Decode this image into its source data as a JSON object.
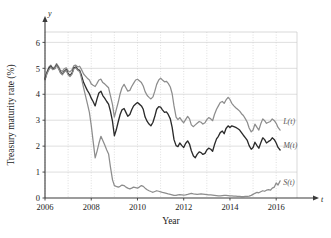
{
  "figure": {
    "ylabel": "Treasury maturity rate (%)",
    "xlabel": "Year",
    "y_axis_name": "y",
    "x_axis_name": "t",
    "yticks": [
      "0",
      "1",
      "2",
      "3",
      "4",
      "5",
      "6"
    ],
    "xticks": [
      "2006",
      "2008",
      "2010",
      "2012",
      "2014",
      "2016"
    ],
    "series_labels": {
      "long": "L(t)",
      "medium": "M(t)",
      "short": "S(t)"
    },
    "colors": {
      "long": "#8d8d8d",
      "medium": "#2b2b2b",
      "short": "#8d8d8d",
      "axis": "#3a3a3a",
      "grid": "#c9c9c9",
      "background": "#ffffff"
    }
  },
  "chart_data": {
    "type": "line",
    "title": "",
    "xlabel": "Year",
    "ylabel": "Treasury maturity rate (%)",
    "xlim": [
      2006,
      2016.9
    ],
    "ylim": [
      0,
      6.4
    ],
    "xticks": [
      2006,
      2008,
      2010,
      2012,
      2014,
      2016
    ],
    "yticks": [
      0,
      1,
      2,
      3,
      4,
      5,
      6
    ],
    "grid": true,
    "grid_minor_x_every": 1,
    "legend": "inline-right-of-curve",
    "annotations": [
      {
        "text": "L(t)",
        "x": 2016.3,
        "y": 2.95
      },
      {
        "text": "M(t)",
        "x": 2016.3,
        "y": 2.05
      },
      {
        "text": "S(t)",
        "x": 2016.3,
        "y": 0.62
      }
    ],
    "x": [
      2006.0,
      2006.08,
      2006.17,
      2006.25,
      2006.33,
      2006.42,
      2006.5,
      2006.58,
      2006.67,
      2006.75,
      2006.83,
      2006.92,
      2007.0,
      2007.08,
      2007.17,
      2007.25,
      2007.33,
      2007.42,
      2007.5,
      2007.58,
      2007.67,
      2007.75,
      2007.83,
      2007.92,
      2008.0,
      2008.08,
      2008.17,
      2008.25,
      2008.33,
      2008.42,
      2008.5,
      2008.58,
      2008.67,
      2008.75,
      2008.83,
      2008.92,
      2009.0,
      2009.08,
      2009.17,
      2009.25,
      2009.33,
      2009.42,
      2009.5,
      2009.58,
      2009.67,
      2009.75,
      2009.83,
      2009.92,
      2010.0,
      2010.08,
      2010.17,
      2010.25,
      2010.33,
      2010.42,
      2010.5,
      2010.58,
      2010.67,
      2010.75,
      2010.83,
      2010.92,
      2011.0,
      2011.08,
      2011.17,
      2011.25,
      2011.33,
      2011.42,
      2011.5,
      2011.58,
      2011.67,
      2011.75,
      2011.83,
      2011.92,
      2012.0,
      2012.08,
      2012.17,
      2012.25,
      2012.33,
      2012.42,
      2012.5,
      2012.58,
      2012.67,
      2012.75,
      2012.83,
      2012.92,
      2013.0,
      2013.08,
      2013.17,
      2013.25,
      2013.33,
      2013.42,
      2013.5,
      2013.58,
      2013.67,
      2013.75,
      2013.83,
      2013.92,
      2014.0,
      2014.08,
      2014.17,
      2014.25,
      2014.33,
      2014.42,
      2014.5,
      2014.58,
      2014.67,
      2014.75,
      2014.83,
      2014.92,
      2015.0,
      2015.08,
      2015.17,
      2015.25,
      2015.33,
      2015.42,
      2015.5,
      2015.58,
      2015.67,
      2015.75,
      2015.83,
      2015.92,
      2016.0,
      2016.08,
      2016.17
    ],
    "series": [
      {
        "name": "L(t)",
        "label": "Long maturity rate",
        "color": "#8d8d8d",
        "values": [
          4.62,
          4.85,
          5.05,
          5.12,
          5.02,
          5.05,
          5.18,
          5.08,
          4.92,
          4.88,
          4.98,
          5.02,
          4.9,
          4.86,
          4.95,
          5.1,
          5.12,
          5.05,
          5.08,
          4.95,
          4.78,
          4.7,
          4.62,
          4.55,
          4.4,
          4.35,
          4.3,
          4.42,
          4.55,
          4.58,
          4.45,
          4.4,
          4.32,
          4.25,
          3.95,
          3.6,
          3.12,
          3.4,
          3.7,
          4.02,
          4.25,
          4.38,
          4.25,
          4.12,
          4.15,
          4.3,
          4.42,
          4.55,
          4.58,
          4.52,
          4.45,
          4.32,
          4.1,
          3.95,
          3.88,
          3.82,
          3.9,
          4.12,
          4.38,
          4.55,
          4.62,
          4.55,
          4.48,
          4.5,
          4.42,
          4.28,
          4.02,
          3.55,
          3.12,
          3.02,
          3.1,
          2.98,
          2.9,
          3.02,
          3.15,
          3.05,
          2.82,
          2.75,
          2.82,
          2.88,
          2.95,
          2.92,
          2.85,
          2.9,
          3.02,
          3.1,
          3.05,
          2.98,
          3.22,
          3.42,
          3.55,
          3.68,
          3.72,
          3.65,
          3.78,
          3.88,
          3.8,
          3.65,
          3.55,
          3.48,
          3.42,
          3.35,
          3.25,
          3.18,
          3.05,
          2.92,
          2.7,
          2.55,
          2.62,
          2.85,
          2.72,
          2.62,
          2.85,
          3.05,
          2.98,
          2.88,
          2.92,
          2.95,
          3.05,
          2.98,
          2.88,
          2.72,
          2.62
        ]
      },
      {
        "name": "M(t)",
        "label": "Medium maturity rate",
        "color": "#2b2b2b",
        "values": [
          4.58,
          4.82,
          5.0,
          5.08,
          4.98,
          5.0,
          5.12,
          5.02,
          4.85,
          4.78,
          4.88,
          4.95,
          4.8,
          4.72,
          4.82,
          5.02,
          5.05,
          4.95,
          4.92,
          4.72,
          4.45,
          4.3,
          4.15,
          4.02,
          3.85,
          3.72,
          3.55,
          3.82,
          4.05,
          4.12,
          3.95,
          3.85,
          3.72,
          3.62,
          3.35,
          2.95,
          2.4,
          2.62,
          2.95,
          3.22,
          3.4,
          3.45,
          3.3,
          3.15,
          3.22,
          3.4,
          3.55,
          3.62,
          3.68,
          3.62,
          3.55,
          3.42,
          3.12,
          2.95,
          2.85,
          2.78,
          2.92,
          3.15,
          3.42,
          3.52,
          3.5,
          3.4,
          3.3,
          3.32,
          3.22,
          3.05,
          2.72,
          2.25,
          2.02,
          1.98,
          2.12,
          2.02,
          1.95,
          2.1,
          2.2,
          2.08,
          1.82,
          1.62,
          1.55,
          1.68,
          1.78,
          1.75,
          1.68,
          1.72,
          1.85,
          1.92,
          1.88,
          1.8,
          2.05,
          2.28,
          2.38,
          2.52,
          2.58,
          2.48,
          2.68,
          2.78,
          2.72,
          2.78,
          2.75,
          2.72,
          2.68,
          2.62,
          2.52,
          2.42,
          2.32,
          2.22,
          2.02,
          1.88,
          1.95,
          2.15,
          2.02,
          1.92,
          2.12,
          2.32,
          2.25,
          2.12,
          2.18,
          2.22,
          2.32,
          2.25,
          2.12,
          1.95,
          1.85
        ]
      },
      {
        "name": "S(t)",
        "label": "Short maturity rate",
        "color": "#8d8d8d",
        "values": [
          4.55,
          4.78,
          4.95,
          5.05,
          4.95,
          4.98,
          5.1,
          5.0,
          4.82,
          4.75,
          4.85,
          4.92,
          4.75,
          4.68,
          4.78,
          4.98,
          5.02,
          4.92,
          4.88,
          4.6,
          4.25,
          3.95,
          3.65,
          3.3,
          2.8,
          2.2,
          1.55,
          1.8,
          2.1,
          2.38,
          2.22,
          2.05,
          1.85,
          1.7,
          1.2,
          0.7,
          0.48,
          0.45,
          0.42,
          0.45,
          0.5,
          0.48,
          0.42,
          0.38,
          0.35,
          0.38,
          0.42,
          0.4,
          0.38,
          0.42,
          0.48,
          0.45,
          0.38,
          0.32,
          0.28,
          0.25,
          0.22,
          0.25,
          0.28,
          0.26,
          0.24,
          0.22,
          0.2,
          0.18,
          0.16,
          0.14,
          0.12,
          0.1,
          0.1,
          0.12,
          0.13,
          0.12,
          0.11,
          0.12,
          0.14,
          0.16,
          0.18,
          0.16,
          0.15,
          0.14,
          0.15,
          0.16,
          0.15,
          0.14,
          0.13,
          0.12,
          0.12,
          0.11,
          0.1,
          0.09,
          0.08,
          0.08,
          0.09,
          0.1,
          0.1,
          0.09,
          0.08,
          0.08,
          0.07,
          0.07,
          0.06,
          0.06,
          0.05,
          0.05,
          0.06,
          0.06,
          0.07,
          0.1,
          0.14,
          0.18,
          0.22,
          0.2,
          0.24,
          0.28,
          0.26,
          0.3,
          0.32,
          0.3,
          0.38,
          0.42,
          0.58,
          0.5,
          0.66
        ]
      }
    ]
  }
}
